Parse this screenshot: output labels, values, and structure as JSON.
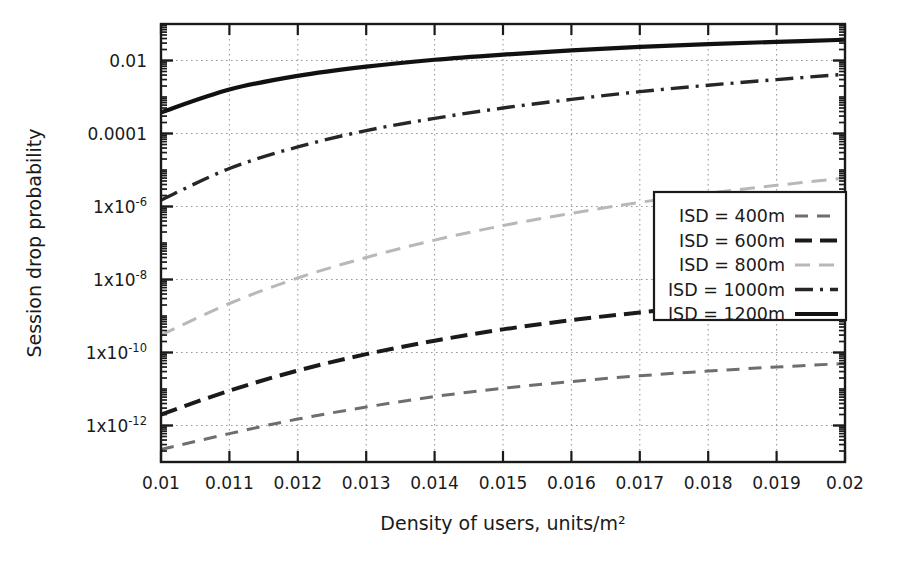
{
  "chart_data": {
    "type": "line",
    "title": "",
    "xlabel": "Density of users, units/m²",
    "ylabel": "Session drop probability",
    "xlim": [
      0.01,
      0.02
    ],
    "ylim": [
      1e-13,
      0.1
    ],
    "yscale": "log",
    "grid": true,
    "legend_position": "center-right",
    "xticks": [
      "0.01",
      "0.011",
      "0.012",
      "0.013",
      "0.014",
      "0.015",
      "0.016",
      "0.017",
      "0.018",
      "0.019",
      "0.02"
    ],
    "xtick_values": [
      0.01,
      0.011,
      0.012,
      0.013,
      0.014,
      0.015,
      0.016,
      0.017,
      0.018,
      0.019,
      0.02
    ],
    "yticks": [
      "0.01",
      "0.0001",
      "1x10-6",
      "1x10-8",
      "1x10-10",
      "1x10-12"
    ],
    "ytick_values": [
      0.01,
      0.0001,
      1e-06,
      1e-08,
      1e-10,
      1e-12
    ],
    "ytick_parts": [
      {
        "base": "0.01",
        "exp": ""
      },
      {
        "base": "0.0001",
        "exp": ""
      },
      {
        "base": "1x10",
        "exp": "-6"
      },
      {
        "base": "1x10",
        "exp": "-8"
      },
      {
        "base": "1x10",
        "exp": "-10"
      },
      {
        "base": "1x10",
        "exp": "-12"
      }
    ],
    "x": [
      0.01,
      0.011,
      0.012,
      0.013,
      0.014,
      0.015,
      0.016,
      0.017,
      0.018,
      0.019,
      0.02
    ],
    "series": [
      {
        "name": "ISD = 400m",
        "label": "ISD = 400m",
        "style": "dashed",
        "color": "#6e6e6e",
        "width": 3.0,
        "dash": "13,9",
        "values": [
          2.2e-13,
          6e-13,
          1.5e-12,
          3.2e-12,
          6.2e-12,
          1.05e-11,
          1.6e-11,
          2.3e-11,
          3.1e-11,
          4e-11,
          5e-11
        ]
      },
      {
        "name": "ISD = 600m",
        "label": "ISD = 600m",
        "style": "dashed-bold",
        "color": "#1a1a1a",
        "width": 4.0,
        "dash": "17,8",
        "values": [
          2e-12,
          9e-12,
          3.2e-11,
          9e-11,
          2.1e-10,
          4.3e-10,
          7.7e-10,
          1.25e-09,
          1.9e-09,
          2.7e-09,
          3.6e-09
        ]
      },
      {
        "name": "ISD = 800m",
        "label": "ISD = 800m",
        "style": "dashed-light",
        "color": "#b8b8b8",
        "width": 3.0,
        "dash": "15,9",
        "values": [
          3e-10,
          2.2e-09,
          1.1e-08,
          4e-08,
          1.2e-07,
          3e-07,
          6.5e-07,
          1.3e-06,
          2.3e-06,
          3.8e-06,
          6e-06
        ]
      },
      {
        "name": "ISD = 1000m",
        "label": "ISD = 1000m",
        "style": "dashdot",
        "color": "#262626",
        "width": 3.4,
        "dash": "18,7,3,7",
        "values": [
          1.5e-06,
          1.1e-05,
          4.3e-05,
          0.00012,
          0.00026,
          0.0005,
          0.00086,
          0.0014,
          0.0021,
          0.003,
          0.0042
        ]
      },
      {
        "name": "ISD = 1200m",
        "label": "ISD = 1200m",
        "style": "solid",
        "color": "#111111",
        "width": 4.2,
        "dash": "",
        "values": [
          0.00038,
          0.0016,
          0.0038,
          0.0068,
          0.0105,
          0.0145,
          0.019,
          0.0235,
          0.028,
          0.0325,
          0.037
        ]
      }
    ]
  },
  "colors": {
    "axis": "#1a1a1a",
    "grid": "#9a9a9a",
    "background": "#ffffff",
    "legend_border": "#1a1a1a"
  }
}
